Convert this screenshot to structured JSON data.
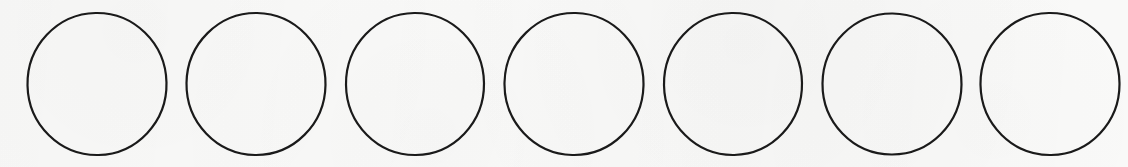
{
  "figure": {
    "kind": "circle-row",
    "count_label": "7",
    "background_color": "#fbfbfa",
    "stroke_color": "#1a1a1a",
    "stroke_width": 2.2,
    "canvas": {
      "width": 1128,
      "height": 167
    },
    "shapes": [
      {
        "name": "circle-1",
        "cx": 97,
        "cy": 84,
        "rx": 69.5,
        "ry": 71.0,
        "rotation": -1.2,
        "fill": "none"
      },
      {
        "name": "circle-2",
        "cx": 256,
        "cy": 84,
        "rx": 69.5,
        "ry": 71.0,
        "rotation": 0.8,
        "fill": "none"
      },
      {
        "name": "circle-3",
        "cx": 415,
        "cy": 84,
        "rx": 69.0,
        "ry": 71.0,
        "rotation": -0.6,
        "fill": "none"
      },
      {
        "name": "circle-4",
        "cx": 574,
        "cy": 84,
        "rx": 69.5,
        "ry": 71.0,
        "rotation": 1.4,
        "fill": "none"
      },
      {
        "name": "circle-5",
        "cx": 733,
        "cy": 84,
        "rx": 69.0,
        "ry": 71.0,
        "rotation": -1.0,
        "fill": "none"
      },
      {
        "name": "circle-6",
        "cx": 892,
        "cy": 84,
        "rx": 69.5,
        "ry": 70.5,
        "rotation": 0.5,
        "fill": "none"
      },
      {
        "name": "circle-7",
        "cx": 1050,
        "cy": 84,
        "rx": 69.5,
        "ry": 71.0,
        "rotation": -0.9,
        "fill": "none"
      }
    ]
  }
}
